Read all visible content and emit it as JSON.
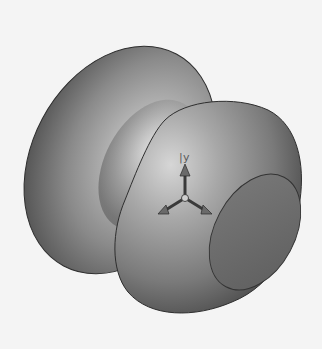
{
  "scene": {
    "description": "Shaded 3D revolved solid (spool / knob shape) with flat circular end face",
    "background_color": "#f4f4f4",
    "body_color": "#8c8c8c",
    "highlight_color": "#e6e6e6",
    "shadow_color": "#3c3c3c"
  },
  "triad": {
    "axis_label": "y",
    "label_prefix": "|"
  }
}
